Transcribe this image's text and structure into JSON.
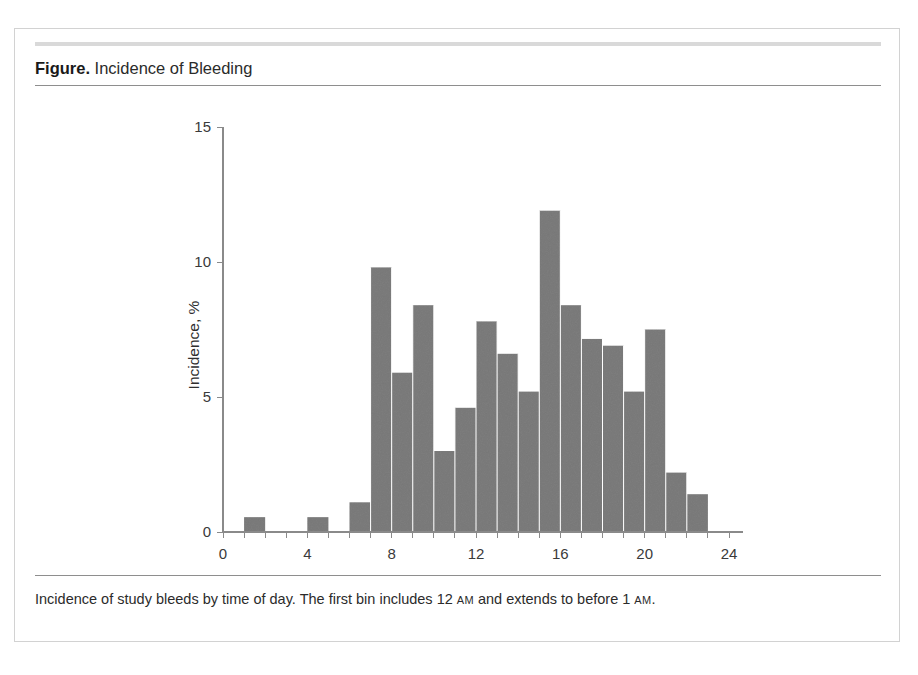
{
  "figure": {
    "label": "Figure.",
    "title": "Incidence of Bleeding",
    "caption_part1": "Incidence of study bleeds by time of day. The first bin includes 12 ",
    "caption_am1": "AM",
    "caption_part2": " and extends to before 1 ",
    "caption_am2": "AM",
    "caption_part3": "."
  },
  "colors": {
    "bar_fill": "#7d7d7d",
    "axis": "#8a8a8a",
    "rule": "#8e8e8e",
    "top_bar": "#d9d9d9",
    "frame": "#d2d2d2",
    "text": "#2b2b2b",
    "background": "#ffffff"
  },
  "chart_data": {
    "type": "bar",
    "title": "Incidence of Bleeding",
    "xlabel": "Time of day, h",
    "ylabel": "Incidence, %",
    "xlim": [
      0,
      24
    ],
    "ylim": [
      0,
      15
    ],
    "xticks": [
      0,
      4,
      8,
      12,
      16,
      20,
      24
    ],
    "xtick_labels": [
      "0",
      "4",
      "8",
      "12",
      "16",
      "20",
      "24"
    ],
    "yticks": [
      0,
      5,
      10,
      15
    ],
    "ytick_labels": [
      "0",
      "5",
      "10",
      "15"
    ],
    "grid": false,
    "legend": "none",
    "bin_width": 1,
    "categories": [
      0,
      1,
      2,
      3,
      4,
      5,
      6,
      7,
      8,
      9,
      10,
      11,
      12,
      13,
      14,
      15,
      16,
      17,
      18,
      19,
      20,
      21,
      22,
      23
    ],
    "values": [
      0,
      0.55,
      0,
      0,
      0.55,
      0,
      1.1,
      9.8,
      5.9,
      8.4,
      3.0,
      4.6,
      7.8,
      6.6,
      5.2,
      11.9,
      8.4,
      7.15,
      6.9,
      5.2,
      7.5,
      2.2,
      1.4,
      0
    ]
  }
}
